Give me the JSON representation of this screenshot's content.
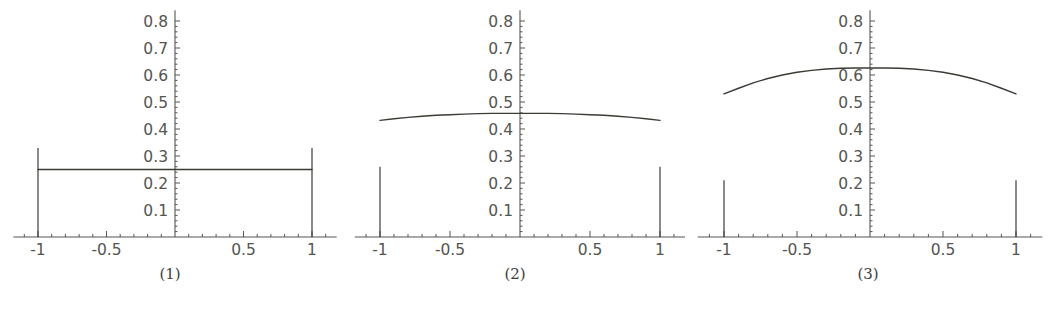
{
  "figure": {
    "background_color": "#ffffff",
    "axis_color": "#555550",
    "curve_color": "#3b3b36",
    "tick_label_color": "#55554f",
    "caption_color": "#40403e",
    "panel_count": 3
  },
  "chart_data": [
    {
      "type": "line",
      "title": "",
      "caption": "(1)",
      "xlabel": "",
      "ylabel": "",
      "xlim": [
        -1.18,
        1.18
      ],
      "ylim": [
        0,
        0.84
      ],
      "grid": false,
      "legend": "none",
      "x_tick_labels": [
        "-1",
        "-0.5",
        "0.5",
        "1"
      ],
      "x_tick_values": [
        -1,
        -0.5,
        0.5,
        1
      ],
      "y_tick_labels": [
        "0.1",
        "0.2",
        "0.3",
        "0.4",
        "0.5",
        "0.6",
        "0.7",
        "0.8"
      ],
      "y_tick_values": [
        0.1,
        0.2,
        0.3,
        0.4,
        0.5,
        0.6,
        0.7,
        0.8
      ],
      "minor_ticks_per_interval": 5,
      "series": [
        {
          "name": "density",
          "x": [
            -1,
            -0.9,
            -0.8,
            -0.7,
            -0.6,
            -0.5,
            -0.4,
            -0.3,
            -0.2,
            -0.1,
            0,
            0.1,
            0.2,
            0.3,
            0.4,
            0.5,
            0.6,
            0.7,
            0.8,
            0.9,
            1
          ],
          "values": [
            0.25,
            0.25,
            0.25,
            0.25,
            0.25,
            0.25,
            0.25,
            0.25,
            0.25,
            0.25,
            0.25,
            0.25,
            0.25,
            0.25,
            0.25,
            0.25,
            0.25,
            0.25,
            0.25,
            0.25,
            0.25
          ]
        }
      ],
      "spikes": [
        {
          "x": -1,
          "height": 0.33
        },
        {
          "x": 1,
          "height": 0.33
        }
      ]
    },
    {
      "type": "line",
      "title": "",
      "caption": "(2)",
      "xlabel": "",
      "ylabel": "",
      "xlim": [
        -1.18,
        1.18
      ],
      "ylim": [
        0,
        0.84
      ],
      "grid": false,
      "legend": "none",
      "x_tick_labels": [
        "-1",
        "-0.5",
        "0.5",
        "1"
      ],
      "x_tick_values": [
        -1,
        -0.5,
        0.5,
        1
      ],
      "y_tick_labels": [
        "0.1",
        "0.2",
        "0.3",
        "0.4",
        "0.5",
        "0.6",
        "0.7",
        "0.8"
      ],
      "y_tick_values": [
        0.1,
        0.2,
        0.3,
        0.4,
        0.5,
        0.6,
        0.7,
        0.8
      ],
      "minor_ticks_per_interval": 5,
      "series": [
        {
          "name": "density",
          "x": [
            -1,
            -0.9,
            -0.8,
            -0.7,
            -0.6,
            -0.5,
            -0.4,
            -0.3,
            -0.2,
            -0.1,
            0,
            0.1,
            0.2,
            0.3,
            0.4,
            0.5,
            0.6,
            0.7,
            0.8,
            0.9,
            1
          ],
          "values": [
            0.432,
            0.438,
            0.443,
            0.447,
            0.451,
            0.453,
            0.455,
            0.457,
            0.458,
            0.458,
            0.458,
            0.458,
            0.458,
            0.457,
            0.455,
            0.453,
            0.451,
            0.447,
            0.443,
            0.438,
            0.432
          ]
        }
      ],
      "spikes": [
        {
          "x": -1,
          "height": 0.26
        },
        {
          "x": 1,
          "height": 0.26
        }
      ]
    },
    {
      "type": "line",
      "title": "",
      "caption": "(3)",
      "xlabel": "",
      "ylabel": "",
      "xlim": [
        -1.18,
        1.18
      ],
      "ylim": [
        0,
        0.84
      ],
      "grid": false,
      "legend": "none",
      "x_tick_labels": [
        "-1",
        "-0.5",
        "0.5",
        "1"
      ],
      "x_tick_values": [
        -1,
        -0.5,
        0.5,
        1
      ],
      "y_tick_labels": [
        "0.1",
        "0.2",
        "0.3",
        "0.4",
        "0.5",
        "0.6",
        "0.7",
        "0.8"
      ],
      "y_tick_values": [
        0.1,
        0.2,
        0.3,
        0.4,
        0.5,
        0.6,
        0.7,
        0.8
      ],
      "minor_ticks_per_interval": 5,
      "series": [
        {
          "name": "density",
          "x": [
            -1,
            -0.9,
            -0.8,
            -0.7,
            -0.6,
            -0.5,
            -0.4,
            -0.3,
            -0.2,
            -0.1,
            0,
            0.1,
            0.2,
            0.3,
            0.4,
            0.5,
            0.6,
            0.7,
            0.8,
            0.9,
            1
          ],
          "values": [
            0.53,
            0.551,
            0.571,
            0.587,
            0.6,
            0.61,
            0.617,
            0.622,
            0.625,
            0.626,
            0.626,
            0.626,
            0.625,
            0.622,
            0.617,
            0.61,
            0.6,
            0.587,
            0.571,
            0.551,
            0.53
          ]
        }
      ],
      "spikes": [
        {
          "x": -1,
          "height": 0.21
        },
        {
          "x": 1,
          "height": 0.21
        }
      ]
    }
  ],
  "panels": [
    {
      "caption": "(1)",
      "left": 0,
      "width": 340,
      "x_origin": 175,
      "x_scale": 137
    },
    {
      "caption": "(2)",
      "left": 345,
      "width": 340,
      "x_origin": 175,
      "x_scale": 140
    },
    {
      "caption": "(3)",
      "left": 693,
      "width": 350,
      "x_origin": 177,
      "x_scale": 146
    }
  ]
}
